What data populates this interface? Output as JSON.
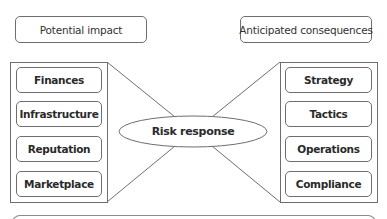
{
  "header": {
    "left_label": "Potential impact",
    "right_label": "Anticipated consequences"
  },
  "left_group": {
    "items": [
      {
        "label": "Finances"
      },
      {
        "label": "Infrastructure"
      },
      {
        "label": "Reputation"
      },
      {
        "label": "Marketplace"
      }
    ]
  },
  "center": {
    "label": "Risk response"
  },
  "right_group": {
    "items": [
      {
        "label": "Strategy"
      },
      {
        "label": "Tactics"
      },
      {
        "label": "Operations"
      },
      {
        "label": "Compliance"
      }
    ]
  },
  "colors": {
    "stroke": "#6e6e6e",
    "text": "#2a2a2a",
    "background": "#ffffff"
  }
}
